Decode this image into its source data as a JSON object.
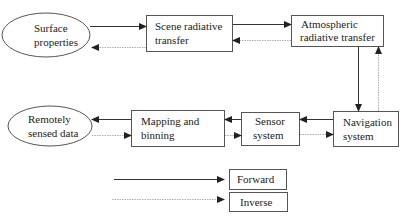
{
  "diagram": {
    "colors": {
      "forward": "#333333",
      "inverse": "#9a9a9a",
      "node_stroke": "#555555"
    },
    "nodes": {
      "surface_properties": {
        "shape": "ellipse",
        "lines": [
          "Surface",
          "properties"
        ]
      },
      "scene_rt": {
        "shape": "box",
        "lines": [
          "Scene radiative",
          "transfer"
        ]
      },
      "atmos_rt": {
        "shape": "box",
        "lines": [
          "Atmospheric",
          "radiative transfer"
        ]
      },
      "navigation": {
        "shape": "box",
        "lines": [
          "Navigation",
          "system"
        ]
      },
      "sensor": {
        "shape": "box",
        "lines": [
          "Sensor",
          "system"
        ]
      },
      "mapping": {
        "shape": "box",
        "lines": [
          "Mapping and",
          "binning"
        ]
      },
      "remote_data": {
        "shape": "ellipse",
        "lines": [
          "Remotely",
          "sensed data"
        ]
      }
    },
    "edges": [
      {
        "from": "Surface properties",
        "to": "Scene radiative transfer",
        "type": "forward"
      },
      {
        "from": "Scene radiative transfer",
        "to": "Surface properties",
        "type": "inverse"
      },
      {
        "from": "Scene radiative transfer",
        "to": "Atmospheric radiative transfer",
        "type": "forward"
      },
      {
        "from": "Atmospheric radiative transfer",
        "to": "Scene radiative transfer",
        "type": "inverse"
      },
      {
        "from": "Atmospheric radiative transfer",
        "to": "Navigation system",
        "type": "forward"
      },
      {
        "from": "Navigation system",
        "to": "Atmospheric radiative transfer",
        "type": "inverse"
      },
      {
        "from": "Navigation system",
        "to": "Sensor system",
        "type": "forward"
      },
      {
        "from": "Sensor system",
        "to": "Navigation system",
        "type": "inverse"
      },
      {
        "from": "Sensor system",
        "to": "Mapping and binning",
        "type": "forward"
      },
      {
        "from": "Mapping and binning",
        "to": "Sensor system",
        "type": "inverse"
      },
      {
        "from": "Mapping and binning",
        "to": "Remotely sensed data",
        "type": "forward"
      },
      {
        "from": "Remotely sensed data",
        "to": "Mapping and binning",
        "type": "inverse"
      }
    ],
    "legend": {
      "forward_label": "Forward",
      "inverse_label": "Inverse"
    }
  }
}
